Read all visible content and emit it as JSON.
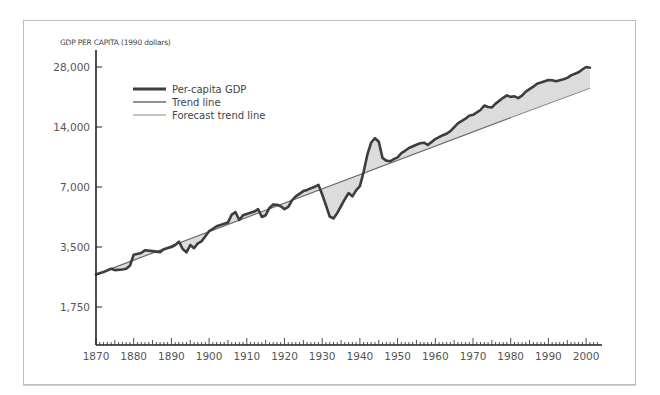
{
  "chart_data": {
    "type": "line",
    "title": "",
    "ylabel": "GDP PER CAPITA (1990 dollars)",
    "xlabel": "",
    "yscale": "log2",
    "ylim": [
      1400,
      30000
    ],
    "xlim": [
      1870,
      2003
    ],
    "grid": false,
    "legend_position": "upper-left",
    "x_ticks": [
      "1870",
      "1880",
      "1890",
      "1900",
      "1910",
      "1920",
      "1930",
      "1940",
      "1950",
      "1960",
      "1970",
      "1980",
      "1990",
      "2000"
    ],
    "y_ticks": [
      "28,000",
      "14,000",
      "7,000",
      "3,500",
      "1,750"
    ],
    "y_tick_values": [
      28000,
      14000,
      7000,
      3500,
      1750
    ],
    "legend": [
      "Per-capita GDP",
      "Trend line",
      "Forecast trend line"
    ],
    "series": [
      {
        "name": "Per-capita GDP",
        "x": [
          1870,
          1872,
          1874,
          1875,
          1877,
          1878,
          1879,
          1880,
          1882,
          1883,
          1885,
          1887,
          1888,
          1890,
          1891,
          1892,
          1893,
          1894,
          1895,
          1896,
          1897,
          1898,
          1900,
          1901,
          1902,
          1903,
          1905,
          1906,
          1907,
          1908,
          1909,
          1910,
          1912,
          1913,
          1914,
          1915,
          1916,
          1917,
          1918,
          1919,
          1920,
          1921,
          1922,
          1923,
          1925,
          1926,
          1928,
          1929,
          1930,
          1931,
          1932,
          1933,
          1934,
          1935,
          1936,
          1937,
          1938,
          1939,
          1940,
          1941,
          1942,
          1943,
          1944,
          1945,
          1946,
          1947,
          1948,
          1949,
          1950,
          1951,
          1952,
          1953,
          1955,
          1956,
          1957,
          1958,
          1959,
          1960,
          1962,
          1963,
          1964,
          1966,
          1968,
          1969,
          1970,
          1972,
          1973,
          1974,
          1975,
          1976,
          1978,
          1979,
          1980,
          1981,
          1982,
          1983,
          1984,
          1986,
          1987,
          1988,
          1990,
          1991,
          1992,
          1994,
          1995,
          1996,
          1998,
          1999,
          2000,
          2001
        ],
        "values": [
          2550,
          2620,
          2720,
          2680,
          2700,
          2720,
          2820,
          3200,
          3270,
          3370,
          3340,
          3300,
          3410,
          3500,
          3580,
          3720,
          3420,
          3290,
          3580,
          3450,
          3650,
          3740,
          4200,
          4320,
          4450,
          4520,
          4640,
          5090,
          5230,
          4780,
          5050,
          5120,
          5270,
          5420,
          4950,
          5050,
          5500,
          5710,
          5700,
          5600,
          5420,
          5560,
          6000,
          6280,
          6680,
          6770,
          7020,
          7180,
          6420,
          5660,
          4980,
          4870,
          5190,
          5620,
          6080,
          6530,
          6280,
          6740,
          7070,
          8360,
          10200,
          11700,
          12300,
          11800,
          9800,
          9500,
          9420,
          9660,
          9850,
          10350,
          10640,
          10990,
          11400,
          11610,
          11680,
          11380,
          11760,
          12180,
          12740,
          12950,
          13360,
          14600,
          15400,
          15950,
          16120,
          17040,
          17940,
          17640,
          17550,
          18340,
          19620,
          20160,
          19820,
          19960,
          19540,
          20130,
          21040,
          22300,
          23090,
          23380,
          24090,
          24010,
          23750,
          24300,
          24680,
          25420,
          26380,
          27190,
          28000,
          27770
        ]
      },
      {
        "name": "Trend line",
        "x": [
          1870,
          1980
        ],
        "values": [
          2550,
          15600
        ]
      },
      {
        "name": "Forecast trend line",
        "x": [
          1980,
          2001
        ],
        "values": [
          15600,
          21900
        ]
      }
    ],
    "annotations": [
      "Shaded area between per-capita GDP and trend line"
    ]
  },
  "colors": {
    "gdp_line": "#3d3d3d",
    "trend_line": "#6b6b6b",
    "forecast_line": "#8a8a8a",
    "fill": "#dcdcdc",
    "axis": "#222222",
    "frame": "#bdbdbd"
  }
}
